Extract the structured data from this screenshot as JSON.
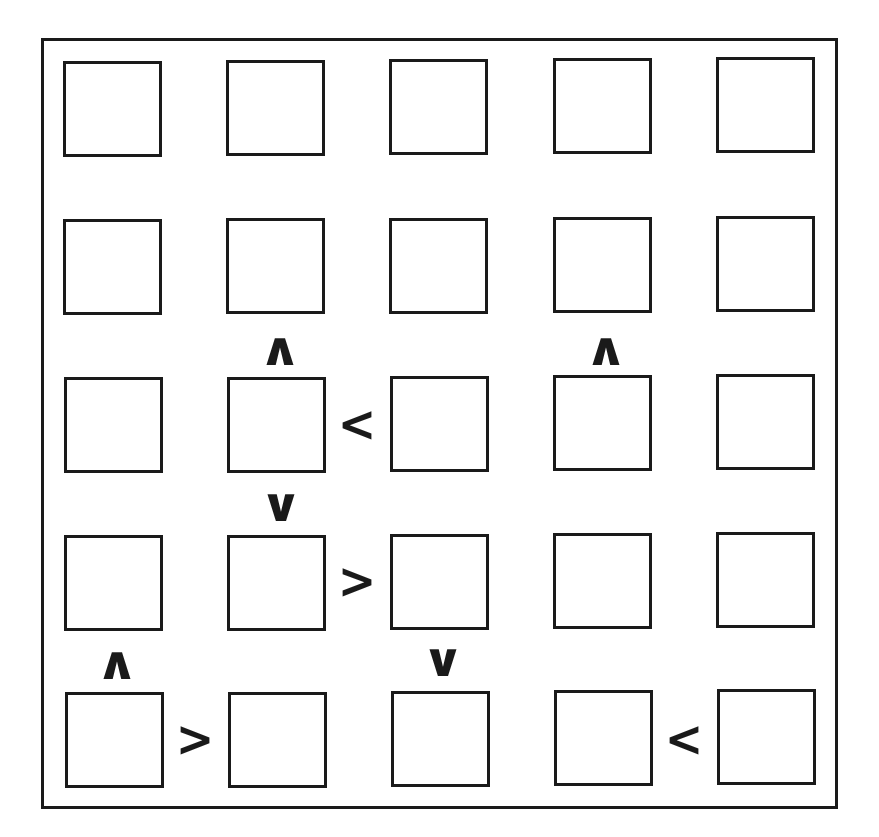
{
  "puzzle": {
    "type": "futoshiki",
    "size": 5,
    "colors": {
      "line": "#1a1a1a",
      "background": "#ffffff"
    },
    "cells": [
      [
        "",
        "",
        "",
        "",
        ""
      ],
      [
        "",
        "",
        "",
        "",
        ""
      ],
      [
        "",
        "",
        "",
        "",
        ""
      ],
      [
        "",
        "",
        "",
        "",
        ""
      ],
      [
        "",
        "",
        "",
        "",
        ""
      ]
    ],
    "constraints": [
      {
        "id": "c1",
        "glyph": "∧",
        "orientation": "vertical",
        "between": [
          [
            2,
            2
          ],
          [
            3,
            2
          ]
        ],
        "x": 280,
        "y": 349
      },
      {
        "id": "c2",
        "glyph": "∧",
        "orientation": "vertical",
        "between": [
          [
            2,
            4
          ],
          [
            3,
            4
          ]
        ],
        "x": 606,
        "y": 349
      },
      {
        "id": "c3",
        "glyph": "<",
        "orientation": "horizontal",
        "between": [
          [
            3,
            2
          ],
          [
            3,
            3
          ]
        ],
        "x": 357,
        "y": 423
      },
      {
        "id": "c4",
        "glyph": "∨",
        "orientation": "vertical",
        "between": [
          [
            3,
            2
          ],
          [
            4,
            2
          ]
        ],
        "x": 281,
        "y": 505
      },
      {
        "id": "c5",
        "glyph": ">",
        "orientation": "horizontal",
        "between": [
          [
            4,
            2
          ],
          [
            4,
            3
          ]
        ],
        "x": 357,
        "y": 580
      },
      {
        "id": "c6",
        "glyph": "∧",
        "orientation": "vertical",
        "between": [
          [
            4,
            1
          ],
          [
            5,
            1
          ]
        ],
        "x": 117,
        "y": 663
      },
      {
        "id": "c7",
        "glyph": "∨",
        "orientation": "vertical",
        "between": [
          [
            4,
            3
          ],
          [
            5,
            3
          ]
        ],
        "x": 443,
        "y": 660
      },
      {
        "id": "c8",
        "glyph": ">",
        "orientation": "horizontal",
        "between": [
          [
            5,
            1
          ],
          [
            5,
            2
          ]
        ],
        "x": 195,
        "y": 738
      },
      {
        "id": "c9",
        "glyph": "<",
        "orientation": "horizontal",
        "between": [
          [
            5,
            4
          ],
          [
            5,
            5
          ]
        ],
        "x": 684,
        "y": 738
      }
    ]
  }
}
